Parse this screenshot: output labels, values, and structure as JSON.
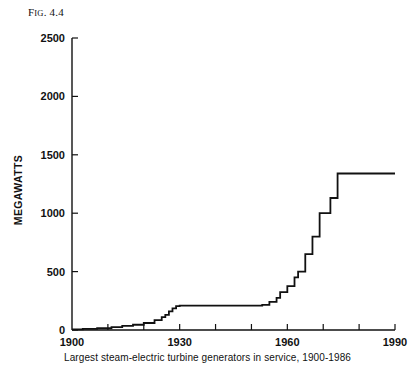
{
  "figure": {
    "number_prefix": "F",
    "number_smallcaps": "IG",
    "number_suffix": ". 4.4"
  },
  "chart_data": {
    "type": "line",
    "line_style": "step-post",
    "title": "",
    "caption": "Largest steam-electric turbine generators in service, 1900-1986",
    "xlabel": "",
    "ylabel": "MEGAWATTS",
    "xlim": [
      1900,
      1990
    ],
    "ylim": [
      0,
      2500
    ],
    "grid": false,
    "legend": null,
    "x_major_ticks": [
      1900,
      1930,
      1960,
      1990
    ],
    "x_major_tick_labels": [
      "1900",
      "1930",
      "1960",
      "1990"
    ],
    "x_minor_tick_interval": 10,
    "x_minor_ticks": [
      1910,
      1920,
      1940,
      1950,
      1970,
      1980
    ],
    "y_ticks": [
      0,
      500,
      1000,
      1500,
      2000,
      2500
    ],
    "y_tick_labels": [
      "0",
      "500",
      "1000",
      "1500",
      "2000",
      "2500"
    ],
    "series": [
      {
        "name": "Largest steam-electric turbine generator in service",
        "units": "MW",
        "x": [
          1900,
          1903,
          1907,
          1911,
          1914,
          1917,
          1920,
          1923,
          1925,
          1926,
          1927,
          1928,
          1929,
          1930,
          1953,
          1955,
          1957,
          1958,
          1960,
          1962,
          1963,
          1965,
          1967,
          1969,
          1972,
          1974,
          1986
        ],
        "values": [
          5,
          10,
          15,
          25,
          35,
          45,
          60,
          85,
          110,
          130,
          160,
          185,
          205,
          208,
          215,
          240,
          275,
          325,
          375,
          450,
          500,
          650,
          800,
          1000,
          1130,
          1340,
          1340
        ]
      }
    ]
  }
}
